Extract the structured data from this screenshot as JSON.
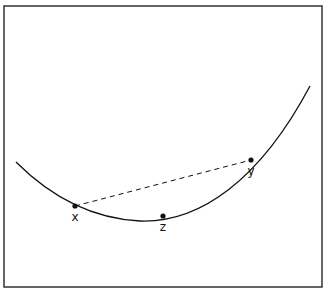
{
  "figure": {
    "frame": {
      "x": 4,
      "y": 6,
      "width": 318,
      "height": 281,
      "stroke": "#333333"
    },
    "curve": {
      "stroke": "#111111",
      "path": "M 16 162 C 40 186, 80 218, 140 221 C 200 223, 260 180, 310 86"
    },
    "chord": {
      "from": "x",
      "to": "y",
      "style": "dashed",
      "stroke": "#111111"
    },
    "points": [
      {
        "id": "x",
        "label": "x",
        "cx": 75,
        "cy": 206,
        "label_x": 75,
        "label_y": 221
      },
      {
        "id": "z",
        "label": "z",
        "cx": 163,
        "cy": 216,
        "label_x": 163,
        "label_y": 231
      },
      {
        "id": "y",
        "label": "y",
        "cx": 251,
        "cy": 160,
        "label_x": 251,
        "label_y": 175
      }
    ]
  }
}
